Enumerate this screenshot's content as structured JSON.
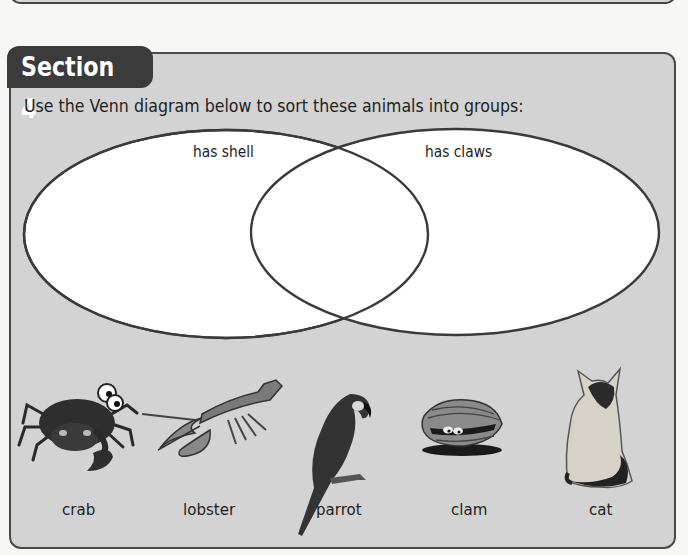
{
  "section": {
    "title": "Section 4",
    "instruction": "Use the Venn diagram below to sort these animals into groups:"
  },
  "venn": {
    "sets": [
      {
        "label": "has shell"
      },
      {
        "label": "has claws"
      }
    ]
  },
  "animals": [
    {
      "name": "crab",
      "icon": "crab-icon"
    },
    {
      "name": "lobster",
      "icon": "lobster-icon"
    },
    {
      "name": "parrot",
      "icon": "parrot-icon"
    },
    {
      "name": "clam",
      "icon": "clam-icon"
    },
    {
      "name": "cat",
      "icon": "cat-icon"
    }
  ],
  "colors": {
    "panel_bg": "#d3d3d3",
    "panel_border": "#4a4a4a",
    "tab_bg": "#3b3b3b",
    "tab_text": "#ffffff",
    "venn_fill": "#ffffff",
    "venn_stroke": "#3a3a3a"
  }
}
